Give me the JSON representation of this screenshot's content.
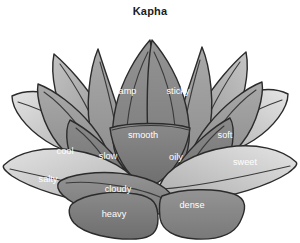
{
  "title": "Kapha",
  "figure": {
    "type": "lotus-diagram",
    "icon_name": "lotus-flower-icon",
    "palette": {
      "background": "#ffffff",
      "outline": "#2b2b2b",
      "vein": "#3a3a3a",
      "label_text": "#ffffff",
      "title_text": "#1c1c1c",
      "petal_light": "#cfcfcf",
      "petal_mid_light": "#b4b4b4",
      "petal_mid": "#9a9a9a",
      "petal_mid_dark": "#8c8c8c",
      "petal_dark": "#7d7d7d",
      "petal_darkest": "#6f6f6f"
    }
  },
  "qualities": [
    {
      "id": "damp",
      "label": "damp",
      "x": 125,
      "y": 68,
      "ring": "inner-top-left"
    },
    {
      "id": "sticky",
      "label": "sticky",
      "x": 178,
      "y": 68,
      "ring": "inner-top-right"
    },
    {
      "id": "smooth",
      "label": "smooth",
      "x": 143,
      "y": 112,
      "ring": "center"
    },
    {
      "id": "cool",
      "label": "cool",
      "x": 65,
      "y": 128,
      "ring": "mid-left"
    },
    {
      "id": "slow",
      "label": "slow",
      "x": 108,
      "y": 133,
      "ring": "inner-left"
    },
    {
      "id": "oily",
      "label": "oily",
      "x": 176,
      "y": 134,
      "ring": "inner-right"
    },
    {
      "id": "soft",
      "label": "soft",
      "x": 225,
      "y": 112,
      "ring": "mid-right"
    },
    {
      "id": "sweet",
      "label": "sweet",
      "x": 245,
      "y": 139,
      "ring": "outer-right"
    },
    {
      "id": "salty",
      "label": "salty",
      "x": 48,
      "y": 156,
      "ring": "outer-left"
    },
    {
      "id": "cloudy",
      "label": "cloudy",
      "x": 118,
      "y": 166,
      "ring": "lower-left"
    },
    {
      "id": "heavy",
      "label": "heavy",
      "x": 114,
      "y": 191,
      "ring": "bottom-left"
    },
    {
      "id": "dense",
      "label": "dense",
      "x": 192,
      "y": 182,
      "ring": "bottom-right"
    }
  ]
}
